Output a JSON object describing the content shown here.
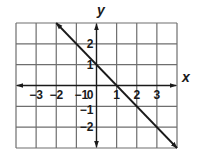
{
  "chart_data": {
    "type": "line",
    "title": "",
    "xlabel": "x",
    "ylabel": "y",
    "xlim": [
      -4,
      4
    ],
    "ylim": [
      -3,
      3
    ],
    "grid": true,
    "legend": null,
    "x_ticks": [
      {
        "value": -3,
        "label": "−3"
      },
      {
        "value": -2,
        "label": "−2"
      },
      {
        "value": -1,
        "label": "−1"
      },
      {
        "value": 0,
        "label": "0"
      },
      {
        "value": 1,
        "label": "1"
      },
      {
        "value": 2,
        "label": "2"
      },
      {
        "value": 3,
        "label": "3"
      }
    ],
    "y_ticks": [
      {
        "value": 2,
        "label": "2"
      },
      {
        "value": 1,
        "label": "1"
      },
      {
        "value": -1,
        "label": "−1"
      },
      {
        "value": -2,
        "label": "−2"
      }
    ],
    "series": [
      {
        "name": "y = -x + 1",
        "slope": -1,
        "intercept": 1,
        "x": [
          -2,
          -1,
          0,
          1,
          2,
          3,
          4
        ],
        "y": [
          3,
          2,
          1,
          0,
          -1,
          -2,
          -3
        ],
        "arrows_both_ends": true,
        "color": "#1a1a1a"
      }
    ]
  },
  "colors": {
    "grid": "#6e6e6e",
    "axis": "#1a1a1a",
    "background": "#ffffff"
  }
}
